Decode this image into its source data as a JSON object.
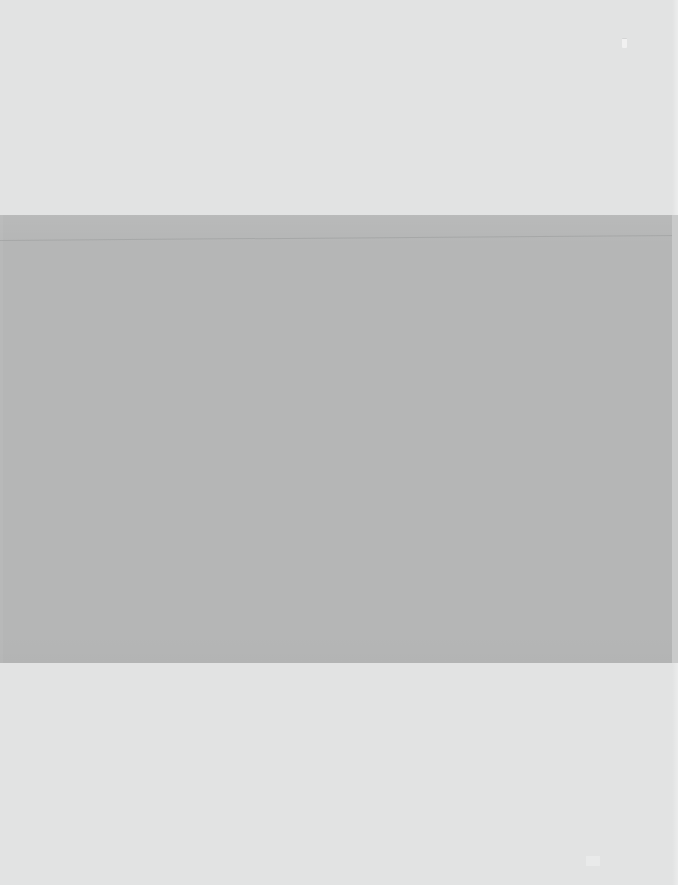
{
  "screen": {
    "kind": "blank-loading-screen",
    "width_px": 678,
    "height_px": 885,
    "description": "Blank application window with no rendered text or controls",
    "background_color": "#e2e3e3"
  },
  "regions": {
    "top": {
      "name": "Top blank area",
      "label": "",
      "color": "#e2e3e3",
      "top_px": 0,
      "height_px": 215
    },
    "panel": {
      "name": "Main content panel",
      "label": "",
      "color": "#b5b6b6",
      "top_px": 215,
      "left_px": 0,
      "width_px": 672,
      "height_px": 448
    },
    "right_gutter": {
      "name": "Right edge strip",
      "label": "",
      "color": "#c9caca",
      "left_px": 672,
      "width_px": 6
    },
    "bottom": {
      "name": "Bottom blank area",
      "label": "",
      "color": "#e2e3e3",
      "top_px": 663,
      "height_px": 222
    }
  },
  "artifacts": {
    "hairline": {
      "name": "Faint slanted hairline near panel top",
      "label": "",
      "color": "#8c8e90",
      "top_px": 240
    },
    "speck": {
      "name": "Small pale speck near top right",
      "label": "",
      "color": "#ffffff",
      "left_px": 622,
      "top_px": 38
    },
    "smudge": {
      "name": "Faint texture smudge near bottom right",
      "label": "",
      "color": "#ffffff",
      "left_px": 586,
      "top_px": 856
    }
  },
  "content": {
    "visible_text": "",
    "buttons": [],
    "inputs": [],
    "icons": []
  }
}
